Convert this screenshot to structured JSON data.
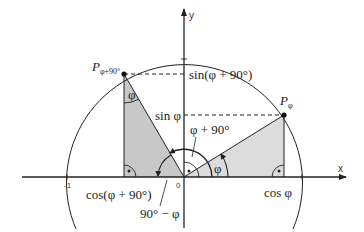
{
  "diagram": {
    "axes": {
      "x_label": "x",
      "y_label": "y",
      "origin_label": "0",
      "neg_one_label": "-1"
    },
    "points": {
      "p_phi": {
        "letter": "P",
        "subscript": "φ"
      },
      "p_phi90": {
        "letter": "P",
        "subscript": "φ+90°"
      }
    },
    "labels": {
      "sin_phi90": "sin(φ + 90°)",
      "sin_phi": "sin φ",
      "cos_phi90": "cos(φ + 90°)",
      "cos_phi": "cos φ",
      "angle_phi_plus_90": "φ + 90°",
      "angle_phi_at_origin": "φ",
      "angle_phi_in_triangle": "φ",
      "angle_90_minus_phi": "90° − φ"
    },
    "colors": {
      "stroke": "#222222",
      "triangle_left_fill": "#c8c8c8",
      "triangle_right_fill": "#dcdcdc",
      "background": "#ffffff"
    }
  }
}
